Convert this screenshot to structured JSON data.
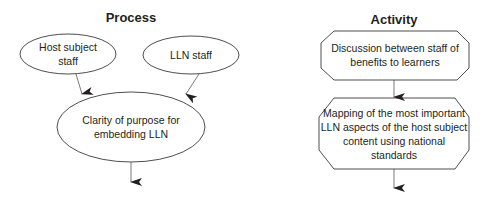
{
  "process": {
    "title": "Process",
    "nodes": [
      {
        "id": "host-subject-staff",
        "shape": "ellipse",
        "text": "Host subject staff",
        "lines": [
          "Host subject",
          "staff"
        ]
      },
      {
        "id": "lln-staff",
        "shape": "ellipse",
        "text": "LLN staff",
        "lines": [
          "LLN staff"
        ]
      },
      {
        "id": "clarity-of-purpose",
        "shape": "ellipse",
        "text": "Clarity of purpose for embedding LLN",
        "lines": [
          "Clarity of purpose for",
          "embedding LLN"
        ]
      }
    ],
    "edges": [
      {
        "from": "host-subject-staff",
        "to": "clarity-of-purpose"
      },
      {
        "from": "lln-staff",
        "to": "clarity-of-purpose"
      },
      {
        "from": "clarity-of-purpose",
        "to": "continues"
      }
    ]
  },
  "activity": {
    "title": "Activity",
    "nodes": [
      {
        "id": "discussion",
        "shape": "octagon",
        "text": "Discussion between staff of benefits to learners",
        "lines": [
          "Discussion between staff of",
          "benefits to learners"
        ]
      },
      {
        "id": "mapping",
        "shape": "octagon",
        "text": "Mapping of the most important LLN aspects of the host subject content using national standards",
        "lines": [
          "Mapping of the most important",
          "LLN aspects of the host subject",
          "content using national standards"
        ]
      }
    ],
    "edges": [
      {
        "from": "discussion",
        "to": "mapping"
      },
      {
        "from": "mapping",
        "to": "continues"
      }
    ]
  },
  "colors": {
    "stroke": "#231f20",
    "text": "#231f20",
    "background": "#ffffff"
  }
}
